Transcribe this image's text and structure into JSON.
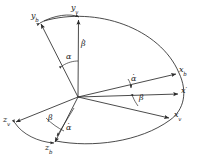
{
  "figure": {
    "background_color": "#ffffff",
    "stroke_color": "#2b2b2b",
    "text_color": "#1a1a1a",
    "axes": [
      {
        "id": "y_b",
        "base": "y",
        "sub": "b",
        "prime": false,
        "label": "y",
        "subscript": "b"
      },
      {
        "id": "y_v",
        "base": "y",
        "sub": "v",
        "prime": false,
        "label": "y",
        "subscript": "v"
      },
      {
        "id": "x_b",
        "base": "x",
        "sub": "b",
        "prime": false,
        "label": "x",
        "subscript": "b"
      },
      {
        "id": "x_pr",
        "base": "x",
        "sub": "",
        "prime": true,
        "label": "x",
        "subscript": ""
      },
      {
        "id": "x_v",
        "base": "x",
        "sub": "v",
        "prime": false,
        "label": "x",
        "subscript": "v"
      },
      {
        "id": "z_v",
        "base": "z",
        "sub": "v",
        "prime": false,
        "label": "z",
        "subscript": "v"
      },
      {
        "id": "z_b",
        "base": "z",
        "sub": "b",
        "prime": false,
        "label": "z",
        "subscript": "b"
      }
    ],
    "angles": [
      {
        "id": "alpha_upper_left",
        "symbol": "α",
        "dot": false
      },
      {
        "id": "beta_upper_vert",
        "symbol": "β",
        "dot": true
      },
      {
        "id": "alpha_center_right",
        "symbol": "α",
        "dot": true
      },
      {
        "id": "beta_center_right",
        "symbol": "β",
        "dot": false
      },
      {
        "id": "beta_lower_left",
        "symbol": "β",
        "dot": false
      },
      {
        "id": "alpha_lower_left",
        "symbol": "α",
        "dot": true
      }
    ],
    "labels": {
      "y_b": "y",
      "y_b_sub": "b",
      "y_v": "y",
      "y_v_sub": "v",
      "x_b": "x",
      "x_b_sub": "b",
      "x_prime": "x",
      "x_prime_mark": "′",
      "x_v": "x",
      "x_v_sub": "v",
      "z_v": "z",
      "z_v_sub": "v",
      "z_b": "z",
      "z_b_sub": "b",
      "alpha": "α",
      "beta": "β",
      "dot_accent": "·"
    }
  }
}
